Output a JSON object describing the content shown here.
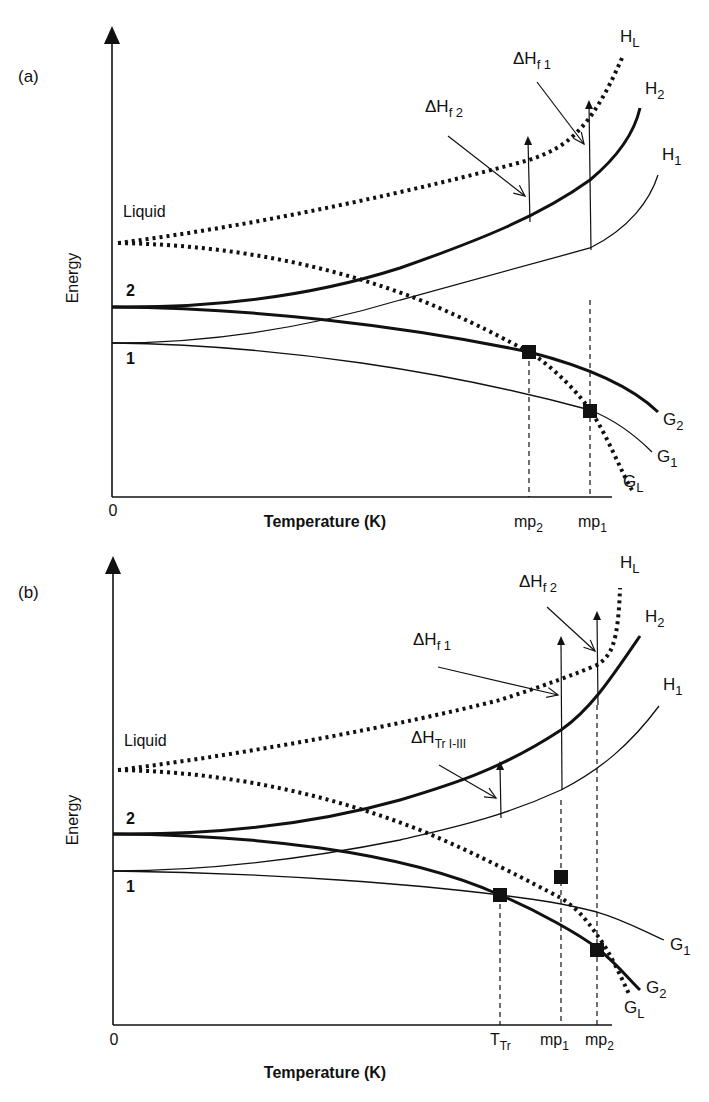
{
  "panels": [
    {
      "id": "a",
      "label": "(a)",
      "y_axis_label": "Energy",
      "x_axis_label": "Temperature (K)",
      "origin_label": "0",
      "liquid_label": "Liquid",
      "form2_label": "2",
      "form1_label": "1",
      "curves": {
        "HL": {
          "main": "H",
          "sub": "L"
        },
        "H2": {
          "main": "H",
          "sub": "2"
        },
        "H1": {
          "main": "H",
          "sub": "1"
        },
        "G2": {
          "main": "G",
          "sub": "2"
        },
        "G1": {
          "main": "G",
          "sub": "1"
        },
        "GL": {
          "main": "G",
          "sub": "L"
        }
      },
      "annotations": [
        {
          "main": "ΔH",
          "sub": "f 1"
        },
        {
          "main": "ΔH",
          "sub": "f 2"
        }
      ],
      "x_ticks": [
        {
          "main": "mp",
          "sub": "2"
        },
        {
          "main": "mp",
          "sub": "1"
        }
      ]
    },
    {
      "id": "b",
      "label": "(b)",
      "y_axis_label": "Energy",
      "x_axis_label": "Temperature (K)",
      "origin_label": "0",
      "liquid_label": "Liquid",
      "form2_label": "2",
      "form1_label": "1",
      "curves": {
        "HL": {
          "main": "H",
          "sub": "L"
        },
        "H2": {
          "main": "H",
          "sub": "2"
        },
        "H1": {
          "main": "H",
          "sub": "1"
        },
        "G1": {
          "main": "G",
          "sub": "1"
        },
        "G2": {
          "main": "G",
          "sub": "2"
        },
        "GL": {
          "main": "G",
          "sub": "L"
        }
      },
      "annotations": [
        {
          "main": "ΔH",
          "sub": "f 2"
        },
        {
          "main": "ΔH",
          "sub": "f 1"
        },
        {
          "main": "ΔH",
          "sub": "Tr I-III"
        }
      ],
      "x_ticks": [
        {
          "main": "T",
          "sub": "Tr"
        },
        {
          "main": "mp",
          "sub": "1"
        },
        {
          "main": "mp",
          "sub": "2"
        }
      ]
    }
  ]
}
